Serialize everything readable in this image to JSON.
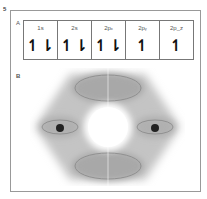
{
  "figure": {
    "number": "5",
    "panel_a": {
      "label": "A",
      "orbitals": [
        {
          "name": "1s",
          "electrons": "↿⇂"
        },
        {
          "name": "2s",
          "electrons": "↿⇂"
        },
        {
          "name": "2pₓ",
          "electrons": "↿⇂"
        },
        {
          "name": "2pᵧ",
          "electrons": "↿"
        },
        {
          "name": "2p_z",
          "electrons": "↿"
        }
      ]
    },
    "panel_b": {
      "label": "B",
      "description": "hexagonal electron cloud with central hole, two nuclei at left and right, elliptical orbit paths"
    },
    "colors": {
      "cloud": "#b8b8b8",
      "cloud_dark": "#9a9a9a",
      "nucleus": "#222222",
      "frame": "#999999"
    }
  }
}
